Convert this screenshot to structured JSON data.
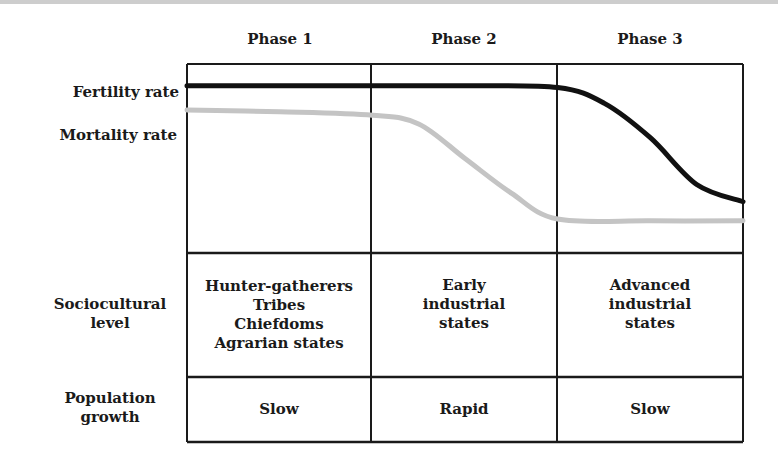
{
  "phases": [
    "Phase 1",
    "Phase 2",
    "Phase 3"
  ],
  "rate_labels": {
    "fertility": "Fertility rate",
    "mortality": "Mortality rate"
  },
  "rows": {
    "sociocultural": {
      "label_lines": [
        "Sociocultural",
        "level"
      ],
      "cells": [
        [
          "Hunter-gatherers",
          "Tribes",
          "Chiefdoms",
          "Agrarian states"
        ],
        [
          "Early",
          "industrial",
          "states"
        ],
        [
          "Advanced",
          "industrial",
          "states"
        ]
      ]
    },
    "population_growth": {
      "label_lines": [
        "Population",
        "growth"
      ],
      "cells": [
        "Slow",
        "Rapid",
        "Slow"
      ]
    }
  },
  "colors": {
    "fertility_line": "#111111",
    "mortality_line": "#c4c4c4",
    "grid": "#1a1a1a"
  },
  "chart_data": {
    "type": "line",
    "title": "",
    "xlabel": "",
    "ylabel": "",
    "x_categories": [
      "Phase 1",
      "Phase 2",
      "Phase 3"
    ],
    "x_range": [
      0,
      3
    ],
    "y_range": [
      0,
      1
    ],
    "series": [
      {
        "name": "Fertility rate",
        "x": [
          0,
          0.5,
          1,
          1.5,
          2,
          2.25,
          2.5,
          2.75,
          3
        ],
        "y": [
          0.92,
          0.92,
          0.92,
          0.92,
          0.91,
          0.82,
          0.62,
          0.35,
          0.25
        ]
      },
      {
        "name": "Mortality rate",
        "x": [
          0,
          0.5,
          1,
          1.25,
          1.5,
          1.75,
          2,
          2.5,
          3
        ],
        "y": [
          0.78,
          0.77,
          0.75,
          0.7,
          0.5,
          0.3,
          0.15,
          0.14,
          0.14
        ]
      }
    ]
  }
}
